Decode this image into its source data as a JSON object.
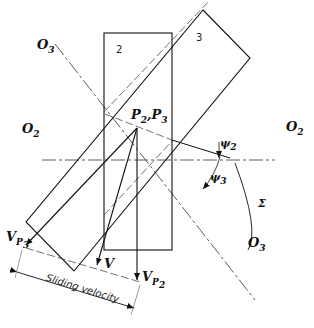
{
  "figure": {
    "labels": {
      "o3_top": {
        "main": "O",
        "sub": "3"
      },
      "o3_bottom": {
        "main": "O",
        "sub": "3"
      },
      "o2_left": {
        "main": "O",
        "sub": "2"
      },
      "o2_right": {
        "main": "O",
        "sub": "2"
      },
      "p_point": {
        "p2": "P",
        "p2sub": "2",
        "sep": ",",
        "p3": "P",
        "p3sub": "3"
      },
      "psi2": {
        "main": "ψ",
        "sub": "2"
      },
      "psi3": {
        "main": "ψ",
        "sub": "3"
      },
      "sigma": "Σ",
      "vp3": {
        "main": "V",
        "sub": "P",
        "subsub": "3"
      },
      "vp2": {
        "main": "V",
        "sub": "P",
        "subsub": "2"
      },
      "v": "V",
      "sliding_velocity": "Sliding velocity"
    },
    "body_numbers": {
      "body2": "2",
      "body3": "3"
    }
  }
}
